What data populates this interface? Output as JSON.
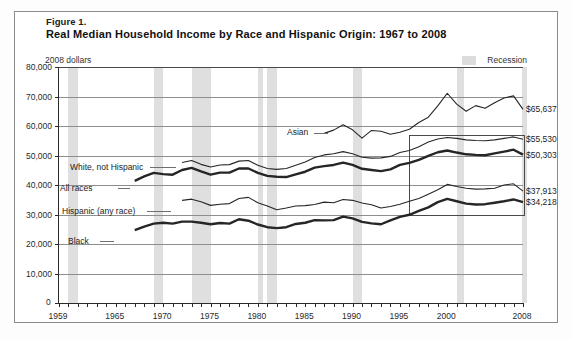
{
  "figure": {
    "number_label": "Figure 1.",
    "title": "Real Median Household Income by Race and Hispanic Origin: 1967 to 2008",
    "units_label": "2008 dollars",
    "recession_legend_label": "Recession",
    "zero_label": "0"
  },
  "chart_data": {
    "type": "line",
    "title": "Real Median Household Income by Race and Hispanic Origin: 1967 to 2008",
    "xlabel": "",
    "ylabel": "2008 dollars",
    "xlim": [
      1959,
      2008
    ],
    "ylim": [
      0,
      80000
    ],
    "grid": true,
    "legend_position": "inline-annotations",
    "ytick_labels": [
      "80,000",
      "70,000",
      "60,000",
      "50,000",
      "40,000",
      "30,000",
      "20,000",
      "10,000",
      "0"
    ],
    "ytick_values": [
      80000,
      70000,
      60000,
      50000,
      40000,
      30000,
      20000,
      10000,
      0
    ],
    "xtick_labels": [
      "1959",
      "1965",
      "1970",
      "1975",
      "1980",
      "1985",
      "1990",
      "1995",
      "2000",
      "2008"
    ],
    "xtick_values": [
      1959,
      1965,
      1970,
      1975,
      1980,
      1985,
      1990,
      1995,
      2000,
      2008
    ],
    "recession_bands": [
      [
        1960,
        1961
      ],
      [
        1969,
        1970
      ],
      [
        1973,
        1975
      ],
      [
        1980,
        1980.5
      ],
      [
        1981,
        1982
      ],
      [
        1990,
        1991
      ],
      [
        2001,
        2001.8
      ],
      [
        2007.9,
        2008
      ]
    ],
    "highlight_box": {
      "x0": 1996,
      "x1": 2008,
      "y0": 30000,
      "y1": 57000
    },
    "series": [
      {
        "name": "Asian",
        "label": "Asian",
        "end_value": 65637,
        "end_value_label": "$65,637",
        "style": "thin-dark",
        "x": [
          1987,
          1988,
          1989,
          1990,
          1991,
          1992,
          1993,
          1994,
          1995,
          1996,
          1997,
          1998,
          1999,
          2000,
          2001,
          2002,
          2003,
          2004,
          2005,
          2006,
          2007,
          2008
        ],
        "values": [
          57500,
          58600,
          60400,
          58700,
          55900,
          58500,
          58200,
          57200,
          57900,
          58900,
          61200,
          63000,
          66800,
          71100,
          67400,
          65000,
          66900,
          66000,
          67900,
          69500,
          70200,
          65637
        ]
      },
      {
        "name": "White, not Hispanic",
        "label": "White, not Hispanic",
        "end_value": 55530,
        "end_value_label": "$55,530",
        "style": "thin-dark",
        "x": [
          1972,
          1973,
          1974,
          1975,
          1976,
          1977,
          1978,
          1979,
          1980,
          1981,
          1982,
          1983,
          1984,
          1985,
          1986,
          1987,
          1988,
          1989,
          1990,
          1991,
          1992,
          1993,
          1994,
          1995,
          1996,
          1997,
          1998,
          1999,
          2000,
          2001,
          2002,
          2003,
          2004,
          2005,
          2006,
          2007,
          2008
        ],
        "values": [
          47600,
          48300,
          47000,
          46100,
          46800,
          46900,
          48100,
          48300,
          46700,
          45600,
          45300,
          45600,
          46700,
          47800,
          49300,
          50200,
          50600,
          51300,
          50600,
          49400,
          49100,
          49200,
          49700,
          51000,
          51700,
          53000,
          54600,
          55600,
          56100,
          55800,
          55300,
          55100,
          55000,
          55300,
          55800,
          56300,
          55530
        ]
      },
      {
        "name": "All races",
        "label": "All races",
        "end_value": 50303,
        "end_value_label": "$50,303",
        "style": "thick-dark",
        "x": [
          1967,
          1968,
          1969,
          1970,
          1971,
          1972,
          1973,
          1974,
          1975,
          1976,
          1977,
          1978,
          1979,
          1980,
          1981,
          1982,
          1983,
          1984,
          1985,
          1986,
          1987,
          1988,
          1989,
          1990,
          1991,
          1992,
          1993,
          1994,
          1995,
          1996,
          1997,
          1998,
          1999,
          2000,
          2001,
          2002,
          2003,
          2004,
          2005,
          2006,
          2007,
          2008
        ],
        "values": [
          41400,
          42900,
          44100,
          43700,
          43500,
          45100,
          45800,
          44600,
          43500,
          44200,
          44200,
          45600,
          45600,
          44100,
          43100,
          42800,
          42700,
          43600,
          44500,
          45900,
          46400,
          46800,
          47600,
          46800,
          45500,
          45100,
          44700,
          45300,
          46800,
          47500,
          48500,
          49900,
          51100,
          51700,
          51000,
          50400,
          50200,
          50100,
          50700,
          51300,
          51970,
          50303
        ]
      },
      {
        "name": "Hispanic (any race)",
        "label": "Hispanic (any race)",
        "end_value": 37913,
        "end_value_label": "$37,913",
        "style": "thin-dark",
        "x": [
          1972,
          1973,
          1974,
          1975,
          1976,
          1977,
          1978,
          1979,
          1980,
          1981,
          1982,
          1983,
          1984,
          1985,
          1986,
          1987,
          1988,
          1989,
          1990,
          1991,
          1992,
          1993,
          1994,
          1995,
          1996,
          1997,
          1998,
          1999,
          2000,
          2001,
          2002,
          2003,
          2004,
          2005,
          2006,
          2007,
          2008
        ],
        "values": [
          34800,
          35200,
          34300,
          33100,
          33500,
          33700,
          35400,
          35800,
          34000,
          32900,
          31600,
          32200,
          32900,
          33000,
          33400,
          34200,
          34000,
          35100,
          34800,
          33900,
          33300,
          32200,
          32700,
          33500,
          34500,
          35400,
          36900,
          38400,
          40200,
          39500,
          38900,
          38600,
          38700,
          38900,
          40000,
          40400,
          37913
        ]
      },
      {
        "name": "Black",
        "label": "Black",
        "end_value": 34218,
        "end_value_label": "$34,218",
        "style": "thick-dark",
        "x": [
          1967,
          1968,
          1969,
          1970,
          1971,
          1972,
          1973,
          1974,
          1975,
          1976,
          1977,
          1978,
          1979,
          1980,
          1981,
          1982,
          1983,
          1984,
          1985,
          1986,
          1987,
          1988,
          1989,
          1990,
          1991,
          1992,
          1993,
          1994,
          1995,
          1996,
          1997,
          1998,
          1999,
          2000,
          2001,
          2002,
          2003,
          2004,
          2005,
          2006,
          2007,
          2008
        ],
        "values": [
          24700,
          25900,
          26900,
          27200,
          26900,
          27600,
          27600,
          27200,
          26700,
          27100,
          26900,
          28400,
          27900,
          26600,
          25700,
          25400,
          25700,
          26800,
          27200,
          28100,
          28000,
          28100,
          29300,
          28700,
          27500,
          27000,
          26700,
          28000,
          29200,
          29900,
          31200,
          32400,
          34200,
          35300,
          34500,
          33700,
          33400,
          33500,
          34000,
          34500,
          35100,
          34218
        ]
      }
    ]
  },
  "annotations": {
    "asian": "Asian",
    "white": "White, not Hispanic",
    "all_races": "All races",
    "hispanic": "Hispanic (any race)",
    "black": "Black"
  }
}
